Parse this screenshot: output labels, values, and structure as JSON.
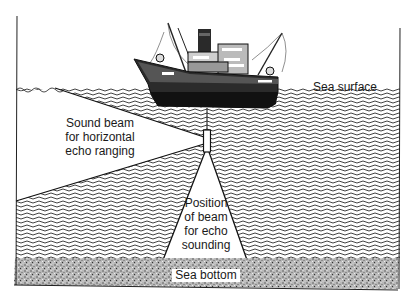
{
  "diagram": {
    "labels": {
      "sea_surface": "Sea surface",
      "horizontal_beam": [
        "Sound beam",
        "for horizontal",
        "echo ranging"
      ],
      "sounding_beam": [
        "Position",
        "of beam",
        "for echo",
        "sounding"
      ],
      "sea_bottom": "Sea bottom"
    },
    "elements": {
      "ship": "trawler-ship-illustration",
      "transducer": "sonar-transducer",
      "water": "wave-hatched-sea",
      "seabed": "stippled-sea-bottom"
    },
    "colors": {
      "ink": "#1a1a1a",
      "water_hatch": "#3a3a3a",
      "paper": "#ffffff",
      "seabed": "#9a9a9a"
    }
  }
}
